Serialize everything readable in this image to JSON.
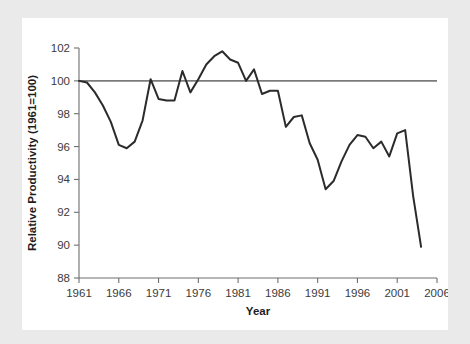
{
  "figure": {
    "background_color": "#eaeaea",
    "card_color": "#ffffff",
    "line_color": "#2b2b2b",
    "reference_line_color": "#7b7b7b",
    "axis_color": "#6f6f6f"
  },
  "chart_data": {
    "type": "line",
    "title": "",
    "xlabel": "Year",
    "ylabel": "Relative Productivity (1961=100)",
    "xlim": [
      1961,
      2006
    ],
    "ylim": [
      88,
      102
    ],
    "grid": false,
    "legend": "none",
    "xticks": [
      1961,
      1966,
      1971,
      1976,
      1981,
      1986,
      1991,
      1996,
      2001,
      2006
    ],
    "yticks": [
      88,
      90,
      92,
      94,
      96,
      98,
      100,
      102
    ],
    "annotations": [
      {
        "name": "reference-line",
        "type": "hline",
        "y": 100,
        "label": "1961 baseline = 100"
      }
    ],
    "series": [
      {
        "name": "Relative Productivity",
        "x": [
          1961,
          1962,
          1963,
          1964,
          1965,
          1966,
          1967,
          1968,
          1969,
          1970,
          1971,
          1972,
          1973,
          1974,
          1975,
          1976,
          1977,
          1978,
          1979,
          1980,
          1981,
          1982,
          1983,
          1984,
          1985,
          1986,
          1987,
          1988,
          1989,
          1990,
          1991,
          1992,
          1993,
          1994,
          1995,
          1996,
          1997,
          1998,
          1999,
          2000,
          2001,
          2002,
          2003,
          2004
        ],
        "values": [
          100.0,
          99.9,
          99.3,
          98.5,
          97.5,
          96.1,
          95.9,
          96.3,
          97.6,
          100.1,
          98.9,
          98.8,
          98.8,
          100.6,
          99.3,
          100.1,
          101.0,
          101.5,
          101.8,
          101.3,
          101.1,
          100.0,
          100.7,
          99.2,
          99.4,
          99.4,
          97.2,
          97.8,
          97.9,
          96.2,
          95.2,
          93.4,
          93.9,
          95.1,
          96.1,
          96.7,
          96.6,
          95.9,
          96.3,
          95.4,
          96.8,
          97.0,
          93.0,
          89.9
        ]
      }
    ]
  }
}
